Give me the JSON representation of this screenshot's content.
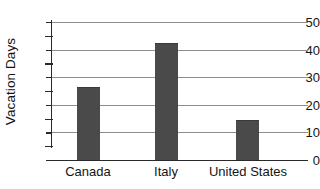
{
  "chart_data": {
    "type": "bar",
    "title": "",
    "xlabel": "",
    "ylabel": "Vacation Days",
    "categories": [
      "Canada",
      "Italy",
      "United States"
    ],
    "values": [
      26,
      42,
      14
    ],
    "ylim": [
      0,
      50
    ],
    "ytick_labels": [
      "0",
      "10",
      "20",
      "30",
      "40",
      "50"
    ],
    "ytick_values": [
      0,
      10,
      20,
      30,
      40,
      50
    ],
    "yminor_ticks": [
      5,
      15,
      25,
      35,
      45
    ],
    "grid": true,
    "legend": false,
    "bar_color": "#4a4a4a",
    "gridline_color": "#8e8e8e",
    "axis_color": "#2a2a2a"
  }
}
